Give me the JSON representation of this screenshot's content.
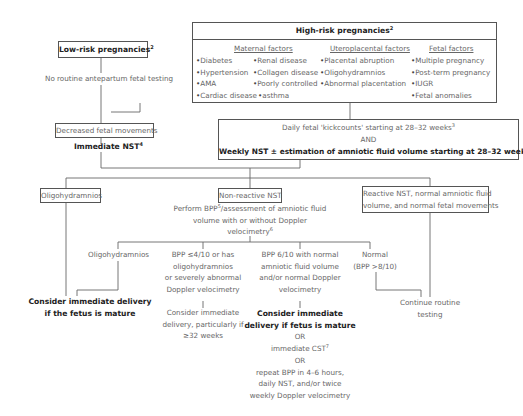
{
  "low_risk": {
    "title": "Low-risk pregnancies",
    "title_sup": "2",
    "note": "No routine antepartum fetal testing"
  },
  "high_risk": {
    "title": "High-risk pregnancies",
    "title_sup": "2",
    "maternal": {
      "heading": "Maternal factors",
      "col1": [
        "Diabetes",
        "Hypertension",
        "AMA",
        "Cardiac disease"
      ],
      "col2": [
        "Renal disease",
        "Collagen disease",
        "Poorly controlled",
        "asthma"
      ]
    },
    "uteroplacental": {
      "heading": "Uteroplacental factors",
      "items": [
        "Placental abruption",
        "Oligohydramnios",
        "Abnormal placentation"
      ]
    },
    "fetal": {
      "heading": "Fetal factors",
      "items": [
        "Multiple pregnancy",
        "Post-term pregnancy",
        "IUGR",
        "Fetal anomalies"
      ]
    }
  },
  "decreased": {
    "label": "Decreased fetal movements",
    "action": "Immediate NST",
    "action_sup": "4"
  },
  "surveillance": {
    "line1": "Daily fetal 'kickcounts' starting at 28–32 weeks",
    "line1_sup": "3",
    "line2": "AND",
    "line3": "Weekly NST ± estimation of amniotic fluid volume starting at 28–32 weeks",
    "line3_sup": "4"
  },
  "branch_oligo": {
    "label": "Oligohydramnios",
    "outcome_line1": "Consider immediate delivery",
    "outcome_line2": "if the fetus is mature"
  },
  "branch_nonreactive": {
    "label": "Non-reactive NST",
    "perform_line1a": "Perform BPP",
    "perform_line1_sup": "5",
    "perform_line1b": "/assessment of amniotic fluid",
    "perform_line2": "volume with or without Doppler",
    "perform_line3": "velocimetry",
    "perform_line3_sup": "6",
    "sub": {
      "oligo": "Oligohydramnios",
      "severe": [
        "BPP ≤4/10 or has",
        "oligohydramnios",
        "or severely abnormal",
        "Doppler velocimetry"
      ],
      "severe_action": [
        "Consider immediate",
        "delivery, particularly if",
        "≥32 weeks"
      ],
      "six": [
        "BPP 6/10 with normal",
        "amniotic fluid volume",
        "and/or normal Doppler",
        "velocimetry"
      ],
      "six_action_bold": [
        "Consider immediate",
        "delivery if fetus is mature"
      ],
      "six_or1": "OR",
      "six_cst": "immediate CST",
      "six_cst_sup": "7",
      "six_or2": "OR",
      "six_repeat": [
        "repeat BPP in 4–6 hours,",
        "daily NST, and/or twice",
        "weekly Doppler velocimetry"
      ],
      "normal": [
        "Normal",
        "(BPP >8/10)"
      ]
    }
  },
  "branch_reactive": {
    "label_line1": "Reactive NST, normal amniotic fluid",
    "label_line2": "volume, and normal fetal movements",
    "outcome": [
      "Continue routine",
      "testing"
    ]
  }
}
